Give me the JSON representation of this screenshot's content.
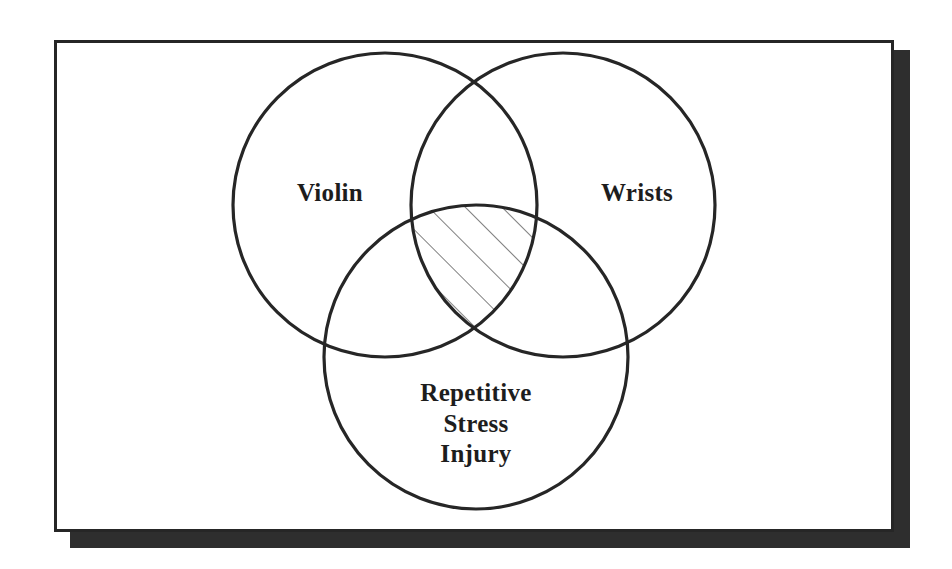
{
  "figure": {
    "type": "venn-diagram",
    "set_count": 3,
    "background_color": "#ffffff",
    "paper_color": "#ffffff",
    "frame_color": "#262626",
    "shadow_color": "#2e2e2e",
    "stroke_color": "#262626",
    "text_color": "#1d1d1d",
    "hatch_color": "#3a3a3a"
  },
  "sets": {
    "top_left": {
      "label": "Violin",
      "cx": 385,
      "cy": 205,
      "r": 152
    },
    "top_right": {
      "label": "Wrists",
      "cx": 563,
      "cy": 205,
      "r": 152
    },
    "bottom": {
      "label": "Repetitive\nStress\nInjury",
      "label_lines": [
        "Repetitive",
        "Stress",
        "Injury"
      ],
      "cx": 476,
      "cy": 357,
      "r": 152
    }
  },
  "intersection": {
    "name": "triple-intersection",
    "fill_style": "diagonal-hatch",
    "hatch_line_count": 5,
    "hatch_angle_degrees": 45
  },
  "frame": {
    "x": 54,
    "y": 40,
    "width": 840,
    "height": 492,
    "border_width": 3,
    "shadow_offset_x": 16,
    "shadow_offset_y": 10
  }
}
